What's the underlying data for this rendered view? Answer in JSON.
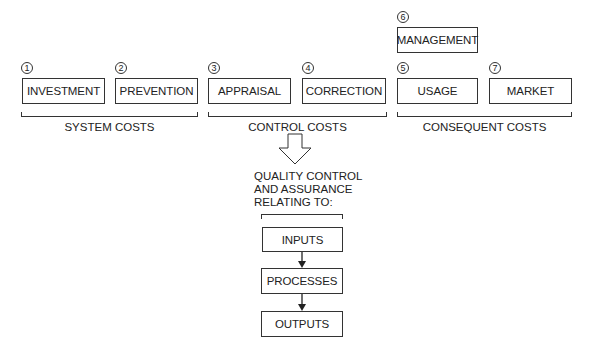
{
  "cost_categories": [
    {
      "number": "1",
      "label": "INVESTMENT"
    },
    {
      "number": "2",
      "label": "PREVENTION"
    },
    {
      "number": "3",
      "label": "APPRAISAL"
    },
    {
      "number": "4",
      "label": "CORRECTION"
    },
    {
      "number": "5",
      "label": "USAGE"
    },
    {
      "number": "6",
      "label": "MANAGEMENT"
    },
    {
      "number": "7",
      "label": "MARKET"
    }
  ],
  "groups": {
    "system": "SYSTEM COSTS",
    "control": "CONTROL COSTS",
    "consequent": "CONSEQUENT COSTS"
  },
  "qc_heading": [
    "QUALITY CONTROL",
    "AND ASSURANCE",
    "RELATING TO:"
  ],
  "flow": [
    "INPUTS",
    "PROCESSES",
    "OUTPUTS"
  ]
}
